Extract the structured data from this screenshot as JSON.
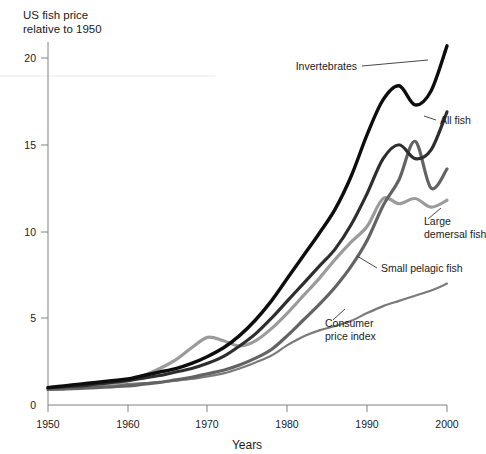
{
  "chart_data": {
    "type": "line",
    "title": "US fish price relative to 1950",
    "title_line1": "US fish price",
    "title_line2": "relative to 1950",
    "xlabel": "Years",
    "ylabel": "",
    "xlim": [
      1950,
      2000
    ],
    "ylim": [
      0,
      21
    ],
    "grid": false,
    "legend_position": "inline-annotations",
    "xticks": [
      1950,
      1960,
      1970,
      1980,
      1990,
      2000
    ],
    "xtick_labels": [
      "1950",
      "1960",
      "1970",
      "1980",
      "1990",
      "2000"
    ],
    "yticks": [
      0,
      5,
      10,
      15,
      20
    ],
    "ytick_labels": [
      "0",
      "5",
      "10",
      "15",
      "20"
    ],
    "x": [
      1950,
      1952,
      1954,
      1956,
      1958,
      1960,
      1962,
      1964,
      1966,
      1968,
      1970,
      1972,
      1974,
      1976,
      1978,
      1980,
      1982,
      1984,
      1986,
      1988,
      1990,
      1992,
      1994,
      1996,
      1998,
      2000
    ],
    "series": [
      {
        "name": "Invertebrates",
        "color": "#0d0d0d",
        "width": 3.4,
        "label": "Invertebrates",
        "values": [
          1.0,
          1.1,
          1.2,
          1.3,
          1.4,
          1.5,
          1.7,
          1.9,
          2.1,
          2.4,
          2.8,
          3.3,
          4.0,
          4.9,
          6.0,
          7.3,
          8.6,
          9.9,
          11.3,
          13.2,
          15.6,
          17.6,
          18.4,
          17.3,
          18.1,
          20.7
        ]
      },
      {
        "name": "All fish",
        "color": "#2e2e2e",
        "width": 3.2,
        "label": "All fish",
        "values": [
          1.0,
          1.05,
          1.1,
          1.2,
          1.3,
          1.4,
          1.55,
          1.7,
          1.9,
          2.1,
          2.4,
          2.8,
          3.4,
          4.1,
          5.0,
          6.0,
          7.0,
          8.0,
          9.0,
          10.4,
          12.2,
          14.2,
          15.0,
          14.2,
          14.7,
          16.9
        ]
      },
      {
        "name": "Large demersal fish",
        "color": "#9b9b9b",
        "width": 3.2,
        "label_line1": "Large",
        "label_line2": "demersal fish",
        "values": [
          0.9,
          0.95,
          1.0,
          1.1,
          1.2,
          1.4,
          1.7,
          2.1,
          2.6,
          3.3,
          3.9,
          3.7,
          3.4,
          3.7,
          4.4,
          5.3,
          6.3,
          7.3,
          8.4,
          9.4,
          10.3,
          11.9,
          11.6,
          11.9,
          11.4,
          11.8
        ]
      },
      {
        "name": "Small pelagic fish",
        "color": "#636363",
        "width": 3.2,
        "label": "Small pelagic fish",
        "values": [
          0.9,
          0.92,
          0.95,
          1.0,
          1.05,
          1.1,
          1.2,
          1.3,
          1.45,
          1.6,
          1.8,
          2.0,
          2.3,
          2.7,
          3.2,
          4.0,
          4.9,
          5.8,
          6.8,
          8.0,
          9.5,
          11.5,
          13.0,
          15.2,
          12.5,
          13.6
        ]
      },
      {
        "name": "Consumer price index",
        "color": "#7a7a7a",
        "width": 2.2,
        "label_line1": "Consumer",
        "label_line2": "price index",
        "values": [
          1.0,
          1.03,
          1.07,
          1.1,
          1.15,
          1.2,
          1.26,
          1.32,
          1.4,
          1.5,
          1.65,
          1.82,
          2.1,
          2.45,
          2.85,
          3.45,
          3.95,
          4.3,
          4.55,
          4.85,
          5.3,
          5.7,
          6.0,
          6.3,
          6.6,
          7.0
        ]
      }
    ],
    "annotations": [
      {
        "text": "Invertebrates",
        "series": "Invertebrates"
      },
      {
        "text": "All fish",
        "series": "All fish"
      },
      {
        "text": "Large demersal fish",
        "series": "Large demersal fish"
      },
      {
        "text": "Small pelagic fish",
        "series": "Small pelagic fish"
      },
      {
        "text": "Consumer price index",
        "series": "Consumer price index"
      }
    ]
  }
}
